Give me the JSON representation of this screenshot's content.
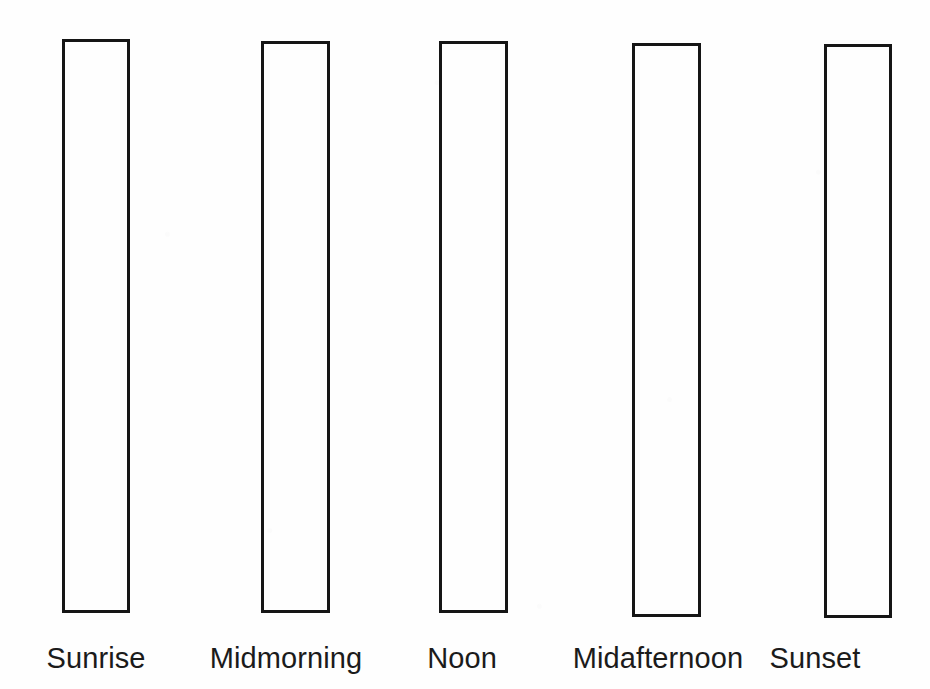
{
  "document": {
    "kind": "worksheet-bar-chart",
    "background_color": "#ffffff",
    "outline_color": "#151515",
    "label_color": "#1b1b1b"
  },
  "chart_data": {
    "type": "bar",
    "title": "",
    "subtitle": "",
    "xlabel": "",
    "ylabel": "",
    "grid": false,
    "legend": null,
    "note": "Blank worksheet chart: all bars drawn as empty outlines of equal full height, awaiting student shading.",
    "categories": [
      "Sunrise",
      "Midmorning",
      "Noon",
      "Midafternoon",
      "Sunset"
    ],
    "values": [
      100,
      100,
      100,
      100,
      100
    ],
    "ylim": [
      0,
      100
    ],
    "bars": [
      {
        "label": "Sunrise",
        "value": 100,
        "filled": false,
        "x": 62,
        "y": 39,
        "width": 68,
        "height": 574,
        "border": 3,
        "label_center_x": 96,
        "label_y": 644
      },
      {
        "label": "Midmorning",
        "value": 100,
        "filled": false,
        "x": 261,
        "y": 41,
        "width": 69,
        "height": 572,
        "border": 3,
        "label_center_x": 286,
        "label_y": 644
      },
      {
        "label": "Noon",
        "value": 100,
        "filled": false,
        "x": 439,
        "y": 41,
        "width": 69,
        "height": 572,
        "border": 3,
        "label_center_x": 462,
        "label_y": 644
      },
      {
        "label": "Midafternoon",
        "value": 100,
        "filled": false,
        "x": 632,
        "y": 43,
        "width": 69,
        "height": 574,
        "border": 3,
        "label_center_x": 658,
        "label_y": 644
      },
      {
        "label": "Sunset",
        "value": 100,
        "filled": false,
        "x": 824,
        "y": 44,
        "width": 68,
        "height": 574,
        "border": 3,
        "label_center_x": 815,
        "label_y": 644
      }
    ]
  }
}
